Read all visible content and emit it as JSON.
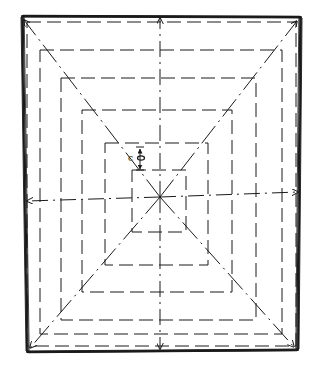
{
  "diagram": {
    "title": "",
    "colors": {
      "ink": "#1a1a1a",
      "background": "#ffffff"
    },
    "outer_frame": {
      "corners": [
        [
          22,
          16
        ],
        [
          301,
          17
        ],
        [
          298,
          350
        ],
        [
          27,
          352
        ]
      ]
    },
    "center": [
      160,
      197
    ],
    "nested_rectangles": [
      {
        "x1": 27,
        "y1": 22,
        "x2": 296,
        "y2": 346
      },
      {
        "x1": 40,
        "y1": 50,
        "x2": 282,
        "y2": 334
      },
      {
        "x1": 61,
        "y1": 78,
        "x2": 256,
        "y2": 320
      },
      {
        "x1": 82,
        "y1": 110,
        "x2": 232,
        "y2": 292
      },
      {
        "x1": 105,
        "y1": 143,
        "x2": 208,
        "y2": 265
      },
      {
        "x1": 132,
        "y1": 170,
        "x2": 186,
        "y2": 232
      }
    ],
    "dimension": {
      "label": "c",
      "sub_glyph": "o",
      "x": 140,
      "y_from": 147,
      "y_to": 170,
      "label_x": 128,
      "label_y": 161
    },
    "arrows": [
      {
        "name": "arrow-up",
        "from": [
          160,
          197
        ],
        "to": [
          160,
          18
        ]
      },
      {
        "name": "arrow-down",
        "from": [
          160,
          197
        ],
        "to": [
          160,
          349
        ]
      },
      {
        "name": "arrow-left",
        "from": [
          160,
          197
        ],
        "to": [
          27,
          201
        ]
      },
      {
        "name": "arrow-right",
        "from": [
          160,
          197
        ],
        "to": [
          298,
          192
        ]
      }
    ],
    "diagonals": [
      {
        "name": "diagonal-top-left",
        "to": [
          24,
          20
        ]
      },
      {
        "name": "diagonal-top-right",
        "to": [
          297,
          21
        ]
      },
      {
        "name": "diagonal-bottom-left",
        "to": [
          30,
          348
        ]
      },
      {
        "name": "diagonal-bottom-right",
        "to": [
          294,
          347
        ]
      }
    ]
  }
}
